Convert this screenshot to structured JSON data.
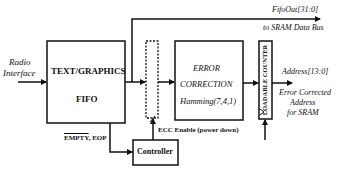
{
  "input": {
    "line1": "Radio",
    "line2": "Interface"
  },
  "fifo": {
    "line1": "TEXT/GRAPHICS",
    "line2": "FIFO"
  },
  "ecc": {
    "line1": "ERROR",
    "line2": "CORRECTION",
    "line3": "Hamming(7,4,1)"
  },
  "counter": {
    "label": "LOADABLE COUNTER"
  },
  "controller": {
    "label": "Controller"
  },
  "signals": {
    "fifo_out": "FifoOut[31:0]",
    "fifo_out_dest": "to SRAM Data Bus",
    "address": "Address[13:0]",
    "address_desc_1": "Error Corrected",
    "address_desc_2": "Address",
    "address_desc_3": "for SRAM",
    "empty_overline": "EMPTY",
    "empty_rest": ", EOP",
    "ecc_enable": "ECC Enable (power down)"
  }
}
